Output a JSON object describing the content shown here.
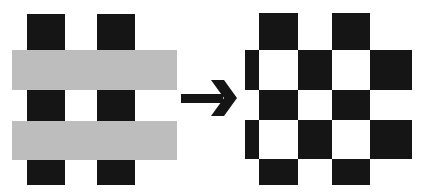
{
  "diagram": {
    "colors": {
      "black": "#151515",
      "gray": "#bdbdbd",
      "background": "#ffffff"
    },
    "left_figure": {
      "vertical_bars": [
        {
          "x": 27,
          "y": 14,
          "w": 38,
          "h": 171
        },
        {
          "x": 97,
          "y": 14,
          "w": 38,
          "h": 171
        }
      ],
      "horizontal_bars": [
        {
          "x": 12,
          "y": 50,
          "w": 165,
          "h": 40
        },
        {
          "x": 12,
          "y": 121,
          "w": 165,
          "h": 39
        }
      ]
    },
    "arrow": {
      "icon": "right-arrow-icon",
      "direction": "right"
    },
    "right_figure": {
      "cells": [
        {
          "x": 259,
          "y": 13,
          "w": 39,
          "h": 37
        },
        {
          "x": 332,
          "y": 13,
          "w": 38,
          "h": 37
        },
        {
          "x": 245,
          "y": 50,
          "w": 14,
          "h": 40
        },
        {
          "x": 298,
          "y": 50,
          "w": 34,
          "h": 40
        },
        {
          "x": 370,
          "y": 50,
          "w": 42,
          "h": 40
        },
        {
          "x": 259,
          "y": 90,
          "w": 39,
          "h": 30
        },
        {
          "x": 332,
          "y": 90,
          "w": 38,
          "h": 30
        },
        {
          "x": 245,
          "y": 120,
          "w": 14,
          "h": 39
        },
        {
          "x": 298,
          "y": 120,
          "w": 34,
          "h": 39
        },
        {
          "x": 370,
          "y": 120,
          "w": 42,
          "h": 39
        },
        {
          "x": 259,
          "y": 159,
          "w": 39,
          "h": 26
        },
        {
          "x": 332,
          "y": 159,
          "w": 38,
          "h": 26
        }
      ]
    }
  }
}
